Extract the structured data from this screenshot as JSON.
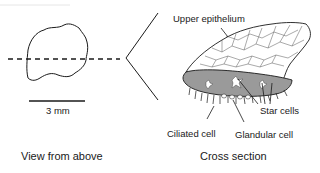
{
  "diagram": {
    "left_panel": {
      "caption": "View from above",
      "scale_bar_label": "3 mm"
    },
    "right_panel": {
      "caption": "Cross section",
      "labels": {
        "upper_epithelium": "Upper epithelium",
        "star_cells": "Star cells",
        "ciliated_cell": "Ciliated cell",
        "glandular_cell": "Glandular cell"
      }
    },
    "colors": {
      "line": "#1a1a1a",
      "lower_layer_fill": "#9a9a9a",
      "background": "#ffffff"
    }
  }
}
